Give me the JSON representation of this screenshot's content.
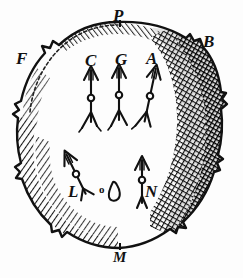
{
  "figure": {
    "kind": "woodcut-engraving",
    "background_color": "#fdfdfd",
    "ink_color": "#111111"
  },
  "cardinal_labels": [
    {
      "id": "P",
      "text": "P",
      "position": "top",
      "x": 113,
      "y": 7,
      "size": "lbl-big"
    },
    {
      "id": "B",
      "text": "B",
      "position": "upper-right",
      "x": 203,
      "y": 33,
      "size": "lbl-big"
    },
    {
      "id": "F",
      "text": "F",
      "position": "upper-left",
      "x": 16,
      "y": 50,
      "size": "lbl-big"
    },
    {
      "id": "M",
      "text": "M",
      "position": "bottom",
      "x": 113,
      "y": 250,
      "size": "lbl-mid"
    }
  ],
  "arrow_labels": [
    {
      "id": "C",
      "text": "C",
      "x": 85,
      "y": 52,
      "size": "lbl-big"
    },
    {
      "id": "G",
      "text": "G",
      "x": 115,
      "y": 51,
      "size": "lbl-big"
    },
    {
      "id": "A",
      "text": "A",
      "x": 146,
      "y": 50,
      "size": "lbl-big"
    },
    {
      "id": "L",
      "text": "L",
      "x": 68,
      "y": 183,
      "size": "lbl-big"
    },
    {
      "id": "N",
      "text": "N",
      "x": 145,
      "y": 183,
      "size": "lbl-big"
    },
    {
      "id": "o",
      "text": "o",
      "x": 99,
      "y": 184,
      "size": "lbl-sm"
    }
  ],
  "arrows": [
    {
      "id": "arrow-C",
      "label": "C",
      "tilt_deg": 0,
      "shaft_x": 91,
      "tip_y": 66,
      "base_y": 122,
      "node_y": 98
    },
    {
      "id": "arrow-G",
      "label": "G",
      "tilt_deg": 0,
      "shaft_x": 119,
      "tip_y": 64,
      "base_y": 120,
      "node_y": 95
    },
    {
      "id": "arrow-A",
      "label": "A",
      "tilt_deg": 12,
      "shaft_x": 150,
      "tip_y": 64,
      "base_y": 122,
      "node_y": 96
    },
    {
      "id": "arrow-L",
      "label": "L",
      "tilt_deg": -28,
      "shaft_x": 72,
      "tip_y": 150,
      "base_y": 196,
      "node_y": 173
    },
    {
      "id": "arrow-N",
      "label": "N",
      "tilt_deg": 0,
      "shaft_x": 142,
      "tip_y": 156,
      "base_y": 203,
      "node_y": 180
    }
  ],
  "ornaments": [
    {
      "id": "teardrop",
      "name": "teardrop-flame-shape",
      "x": 112,
      "y": 182,
      "w": 12,
      "h": 19
    }
  ],
  "sphere": {
    "cx": 118,
    "cy": 140,
    "rx": 102,
    "ry": 118,
    "rim_style": "jagged-rocky",
    "shading": "cross-hatched right limb, hatched lower-left limb",
    "lit_region": "upper-left interior left blank"
  }
}
